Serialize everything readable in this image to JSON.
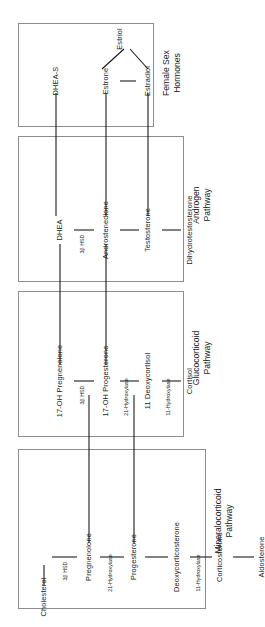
{
  "diagram": {
    "orientation": "rotated-90-ccw",
    "entry_node": "Cholesterol",
    "pathways": [
      {
        "id": "mineralocorticoid",
        "label": "Mineralocorticoid\nPathway",
        "nodes": [
          "Pregnenolone",
          "Progesterone",
          "Deoxycorticosterone",
          "Corticosterone",
          "Aldosterone"
        ],
        "enzymes": [
          "3β HSD",
          "21-Hydroxylase",
          "11-Hydroxylase"
        ]
      },
      {
        "id": "glucocorticoid",
        "label": "Glucocorticoid\nPathway",
        "nodes": [
          "17-OH Pregnenolone",
          "17-OH Progesterone",
          "11 Deoxycortisol",
          "Cortisol"
        ],
        "enzymes": [
          "3β HSD",
          "21-Hydroxylase",
          "11-Hydroxylase"
        ]
      },
      {
        "id": "androgen",
        "label": "Androgen\nPathway",
        "nodes": [
          "DHEA",
          "Androstenedione",
          "Testosterone",
          "Dihydrotestosterone"
        ],
        "enzymes": [
          "3β HSD"
        ]
      },
      {
        "id": "female-sex-hormones",
        "label": "Female Sex\nHormones",
        "nodes": [
          "DHEA-S",
          "Estrone",
          "Estradiol",
          "Estriol"
        ],
        "enzymes": []
      }
    ],
    "colors": {
      "box_border": "#8d8d8d",
      "arrow": "#111111",
      "text": "#1a1a1a",
      "background": "#ffffff"
    }
  }
}
